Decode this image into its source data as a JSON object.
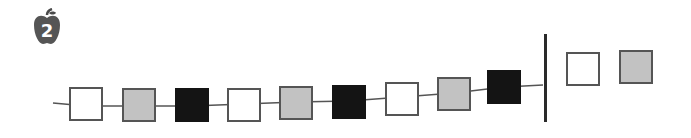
{
  "problem": {
    "number": "2",
    "icon": "apple-icon"
  },
  "colors": {
    "white": "#ffffff",
    "gray": "#c2c2c2",
    "black": "#141414",
    "border": "#555555"
  },
  "pattern": {
    "sequence": [
      "white",
      "gray",
      "black",
      "white",
      "gray",
      "black",
      "white",
      "gray",
      "black"
    ],
    "boxes": [
      {
        "color": "white",
        "x": 69,
        "y": 87
      },
      {
        "color": "gray",
        "x": 122,
        "y": 88
      },
      {
        "color": "black",
        "x": 175,
        "y": 88
      },
      {
        "color": "white",
        "x": 227,
        "y": 88
      },
      {
        "color": "gray",
        "x": 279,
        "y": 86
      },
      {
        "color": "black",
        "x": 332,
        "y": 85
      },
      {
        "color": "white",
        "x": 385,
        "y": 82
      },
      {
        "color": "gray",
        "x": 437,
        "y": 77
      },
      {
        "color": "black",
        "x": 487,
        "y": 70
      }
    ]
  },
  "answer_choices": [
    {
      "color": "white",
      "x": 566,
      "y": 52
    },
    {
      "color": "gray",
      "x": 619,
      "y": 50
    }
  ]
}
